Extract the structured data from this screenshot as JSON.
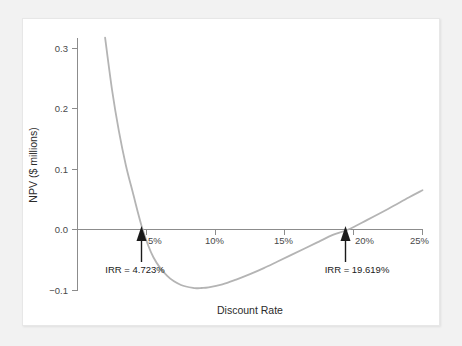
{
  "chart_data": {
    "type": "line",
    "title": "",
    "xlabel": "Discount Rate",
    "ylabel": "NPV ($ millions)",
    "xlim": [
      0,
      26
    ],
    "ylim": [
      -0.12,
      0.33
    ],
    "grid": false,
    "legend": null,
    "x_tick_labels": [
      "5%",
      "10%",
      "15%",
      "20%",
      "25%"
    ],
    "x_tick_values": [
      5,
      10,
      15,
      20,
      25
    ],
    "y_tick_labels": [
      "0.3",
      "0.2",
      "0.1",
      "0.0",
      "−0.1"
    ],
    "y_tick_values": [
      0.3,
      0.2,
      0.1,
      0.0,
      -0.1
    ],
    "series": [
      {
        "name": "NPV",
        "color": "#b4b4b4",
        "x": [
          2.0,
          2.5,
          3.0,
          3.5,
          4.0,
          4.723,
          5.5,
          6.5,
          7.5,
          8.5,
          9.0,
          9.5,
          10.5,
          11.5,
          12.5,
          13.5,
          14.5,
          15.5,
          16.5,
          17.5,
          18.5,
          19.619,
          21.0,
          22.5,
          24.0,
          25.0
        ],
        "y": [
          0.318,
          0.232,
          0.163,
          0.107,
          0.062,
          0.0,
          -0.046,
          -0.077,
          -0.092,
          -0.097,
          -0.097,
          -0.096,
          -0.091,
          -0.083,
          -0.074,
          -0.064,
          -0.053,
          -0.042,
          -0.031,
          -0.02,
          -0.009,
          0.0,
          0.016,
          0.034,
          0.053,
          0.065
        ]
      }
    ],
    "annotations": [
      {
        "name": "irr-low",
        "label": "IRR = 4.723%",
        "x": 4.723,
        "y": 0.0
      },
      {
        "name": "irr-high",
        "label": "IRR = 19.619%",
        "x": 19.619,
        "y": 0.0
      }
    ]
  }
}
